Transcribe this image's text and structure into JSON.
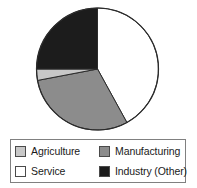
{
  "chart_data": {
    "type": "pie",
    "title": "",
    "subtitle": "",
    "xlabel": "",
    "ylabel": "",
    "grid": false,
    "legend_position": "bottom",
    "start_angle_deg": 0,
    "direction": "clockwise",
    "categories": [
      "Service",
      "Manufacturing",
      "Agriculture",
      "Industry (Other)"
    ],
    "values": [
      42,
      30,
      3,
      25
    ],
    "units": "percent",
    "slices": [
      {
        "label": "Service",
        "value": 42,
        "color": "#ffffff",
        "start_angle_deg": 0,
        "end_angle_deg": 151.2
      },
      {
        "label": "Manufacturing",
        "value": 30,
        "color": "#8c8c8c",
        "start_angle_deg": 151.2,
        "end_angle_deg": 259.2
      },
      {
        "label": "Agriculture",
        "value": 3,
        "color": "#c8c8c8",
        "start_angle_deg": 259.2,
        "end_angle_deg": 270.0
      },
      {
        "label": "Industry (Other)",
        "value": 25,
        "color": "#1c1c1c",
        "start_angle_deg": 270.0,
        "end_angle_deg": 360.0
      }
    ],
    "geometry": {
      "center_x": 97.5,
      "center_y": 69,
      "radius": 61,
      "outline_color": "#2b2b2b",
      "outline_width": 1
    }
  },
  "legend": {
    "entries": [
      {
        "label": "Agriculture",
        "color": "#c8c8c8"
      },
      {
        "label": "Manufacturing",
        "color": "#8c8c8c"
      },
      {
        "label": "Service",
        "color": "#ffffff"
      },
      {
        "label": "Industry (Other)",
        "color": "#1c1c1c"
      }
    ],
    "border_color": "#808080",
    "background": "#ffffff"
  },
  "canvas": {
    "background": "#ffffff",
    "width": 197,
    "height": 188
  }
}
